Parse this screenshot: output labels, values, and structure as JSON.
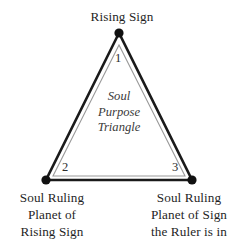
{
  "diagram": {
    "title": "Soul Purpose Triangle",
    "center_caption": "Soul\nPurpose\nTriangle",
    "background_color": "#ffffff",
    "outline_color": "#1a1a1a",
    "inner_outline_color": "#8c8c8c",
    "vertex_dot_color": "#111111",
    "vertices": [
      {
        "number": "1",
        "label": "Rising Sign",
        "position": "top",
        "x": 119,
        "y": 33
      },
      {
        "number": "2",
        "label": "Soul Ruling\nPlanet of\nRising Sign",
        "position": "bottom-left",
        "x": 46,
        "y": 180
      },
      {
        "number": "3",
        "label": "Soul Ruling\nPlanet of Sign\nthe Ruler is in",
        "position": "bottom-right",
        "x": 192,
        "y": 180
      }
    ]
  }
}
